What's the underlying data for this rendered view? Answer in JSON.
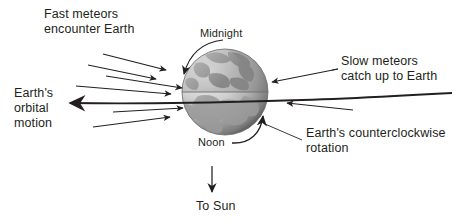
{
  "figure": {
    "background_color": "#ffffff",
    "ink_color": "#231f20"
  },
  "labels": {
    "fast_meteors_line1": "Fast meteors",
    "fast_meteors_line2": "encounter Earth",
    "earth_orbital_line1": "Earth's",
    "earth_orbital_line2": "orbital",
    "earth_orbital_line3": "motion",
    "slow_meteors_line1": "Slow meteors",
    "slow_meteors_line2": "catch up to Earth",
    "rotation_line1": "Earth's counterclockwise",
    "rotation_line2": "rotation",
    "midnight": "Midnight",
    "noon": "Noon",
    "to_sun": "To Sun"
  },
  "diagram_data": {
    "type": "diagram",
    "subject": "Why more meteors are seen after midnight",
    "earth": {
      "center_x": 225,
      "center_y": 92,
      "radius": 43,
      "terminator": "horizontal line through center",
      "lit_side": "bottom (Noon)",
      "dark_side": "top (Midnight)"
    },
    "fast_meteor_arrows": [
      {
        "x1": 103,
        "y1": 55,
        "x2": 167,
        "y2": 70
      },
      {
        "x1": 90,
        "y1": 64,
        "x2": 158,
        "y2": 79
      },
      {
        "x1": 105,
        "y1": 77,
        "x2": 183,
        "y2": 88
      },
      {
        "x1": 78,
        "y1": 87,
        "x2": 172,
        "y2": 94
      }
    ],
    "slow_meteor_arrows": [
      {
        "x1": 206,
        "y1": 101,
        "x2": 131,
        "y2": 105
      },
      {
        "x1": 198,
        "y1": 116,
        "x2": 123,
        "y2": 112
      }
    ],
    "orbital_motion_arrow": {
      "from_x": 290,
      "from_y": 100,
      "to_x": 68,
      "to_y": 103,
      "direction": "left"
    },
    "midnight_pointer": {
      "type": "curved",
      "points_to": "upper-left limb of Earth"
    },
    "noon_rotation_pointer": {
      "type": "curved",
      "points_to": "lower-right limb of Earth",
      "direction": "counterclockwise"
    },
    "to_sun_arrow": {
      "x": 212,
      "y1": 168,
      "y2": 192,
      "direction": "down"
    }
  }
}
